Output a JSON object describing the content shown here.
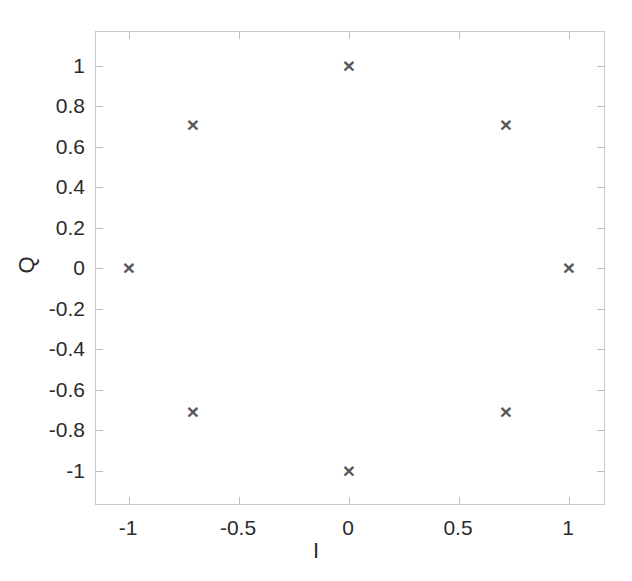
{
  "chart_data": {
    "type": "scatter",
    "title": "",
    "subtitle": "",
    "xlabel": "I",
    "ylabel": "Q",
    "xlim": [
      -1.15,
      1.17
    ],
    "ylim": [
      -1.17,
      1.17
    ],
    "grid": false,
    "legend": null,
    "marker": "x",
    "marker_color": "#585858",
    "series": [
      {
        "name": "8-PSK constellation points",
        "points": [
          {
            "label": "p1",
            "x": 1.0,
            "y": 0.0,
            "px": 473,
            "py": 236
          },
          {
            "label": "p2",
            "x": 0.707,
            "y": 0.707,
            "px": 410,
            "py": 93
          },
          {
            "label": "p3",
            "x": 0.0,
            "y": 1.0,
            "px": 253,
            "py": 34
          },
          {
            "label": "p4",
            "x": -0.707,
            "y": 0.707,
            "px": 97,
            "py": 93
          },
          {
            "label": "p5",
            "x": -1.0,
            "y": 0.0,
            "px": 33,
            "py": 236
          },
          {
            "label": "p6",
            "x": -0.707,
            "y": -0.707,
            "px": 97,
            "py": 380
          },
          {
            "label": "p7",
            "x": 0.0,
            "y": -1.0,
            "px": 253,
            "py": 439
          },
          {
            "label": "p8",
            "x": 0.707,
            "y": -0.707,
            "px": 410,
            "py": 380
          }
        ]
      }
    ],
    "xticks": [
      {
        "value": -1,
        "label": "-1",
        "px": 33
      },
      {
        "value": -0.5,
        "label": "-0.5",
        "px": 143
      },
      {
        "value": 0,
        "label": "0",
        "px": 253
      },
      {
        "value": 0.5,
        "label": "0.5",
        "px": 363
      },
      {
        "value": 1,
        "label": "1",
        "px": 473
      }
    ],
    "yticks": [
      {
        "value": 1,
        "label": "1",
        "py": 34
      },
      {
        "value": 0.8,
        "label": "0.8",
        "py": 74
      },
      {
        "value": 0.6,
        "label": "0.6",
        "py": 115
      },
      {
        "value": 0.4,
        "label": "0.4",
        "py": 155
      },
      {
        "value": 0.2,
        "label": "0.2",
        "py": 196
      },
      {
        "value": 0,
        "label": "0",
        "py": 236
      },
      {
        "value": -0.2,
        "label": "-0.2",
        "py": 277
      },
      {
        "value": -0.4,
        "label": "-0.4",
        "py": 317
      },
      {
        "value": -0.6,
        "label": "-0.6",
        "py": 358
      },
      {
        "value": -0.8,
        "label": "-0.8",
        "py": 398
      },
      {
        "value": -1,
        "label": "-1",
        "py": 439
      }
    ],
    "marker_glyph": "×"
  },
  "figure": {
    "background": "#ffffff",
    "axis_color": "#c9c9c9",
    "text_color": "#2b2b2b"
  }
}
